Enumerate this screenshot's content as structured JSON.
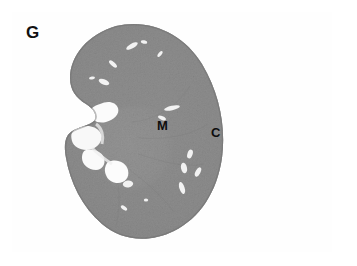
{
  "figure": {
    "panel_label": "G",
    "caption_labels": {
      "medulla": "M",
      "cortex": "C"
    },
    "specimen": "kidney-cross-section",
    "stain_appearance": "grayscale-histology",
    "colors": {
      "background": "#ffffff",
      "frame": "#595959",
      "cortex_tissue": "#8a8a8a",
      "medulla_tissue": "#9b9b9b",
      "vessel_lumen": "#f4f4f4",
      "hilum_white": "#fbfbfb",
      "capsule_edge": "#6d6d6d",
      "label_text": "#111111"
    },
    "icons": {
      "panel_frame": "rectangle-frame-icon",
      "tissue_section": "kidney-section-icon"
    }
  }
}
